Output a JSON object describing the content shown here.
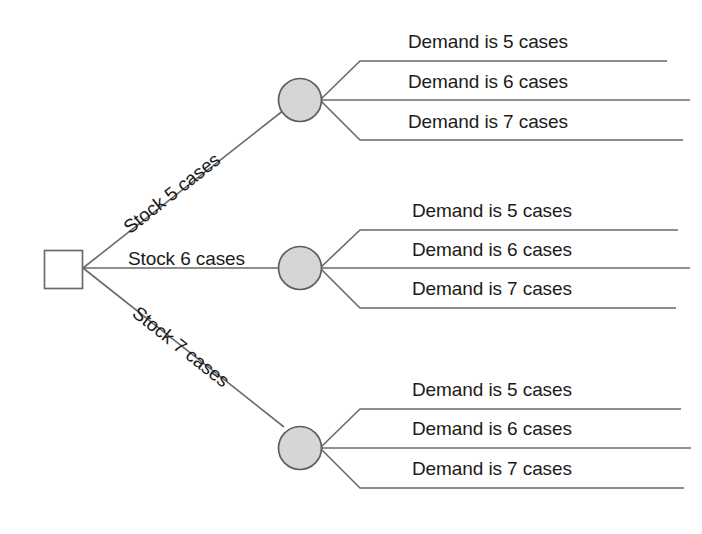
{
  "diagram": {
    "type": "decision-tree",
    "colors": {
      "line": "#6a6a6a",
      "chance_node_fill": "#d6d6d6",
      "chance_node_stroke": "#5d5d5d",
      "decision_node_fill": "#ffffff",
      "decision_node_stroke": "#6a6a6a",
      "text": "#1b1b1b",
      "background": "#ffffff"
    },
    "decision_node": {
      "shape": "square",
      "label": ""
    },
    "branches": [
      {
        "decision_label": "Stock 5 cases",
        "orientation": "up",
        "chance_node_shape": "circle",
        "outcomes": [
          "Demand is 5 cases",
          "Demand is 6 cases",
          "Demand is 7 cases"
        ]
      },
      {
        "decision_label": "Stock 6 cases",
        "orientation": "flat",
        "chance_node_shape": "circle",
        "outcomes": [
          "Demand is 5 cases",
          "Demand is 6 cases",
          "Demand is 7 cases"
        ]
      },
      {
        "decision_label": "Stock 7 cases",
        "orientation": "down",
        "chance_node_shape": "circle",
        "outcomes": [
          "Demand is 5 cases",
          "Demand is 6 cases",
          "Demand is 7 cases"
        ]
      }
    ]
  }
}
